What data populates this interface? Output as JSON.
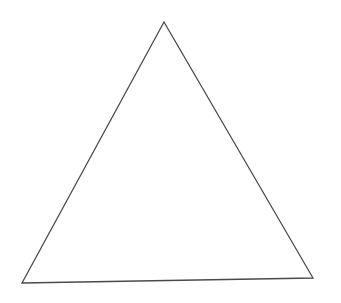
{
  "diagram": {
    "shape": "triangle",
    "fill": "none",
    "stroke_color": "#4a4a4a",
    "stroke_width": 1.3,
    "background": "#ffffff",
    "vertices": {
      "top": {
        "x": 164,
        "y": 22
      },
      "bottom_left": {
        "x": 22,
        "y": 283
      },
      "bottom_right": {
        "x": 313,
        "y": 278
      }
    }
  }
}
